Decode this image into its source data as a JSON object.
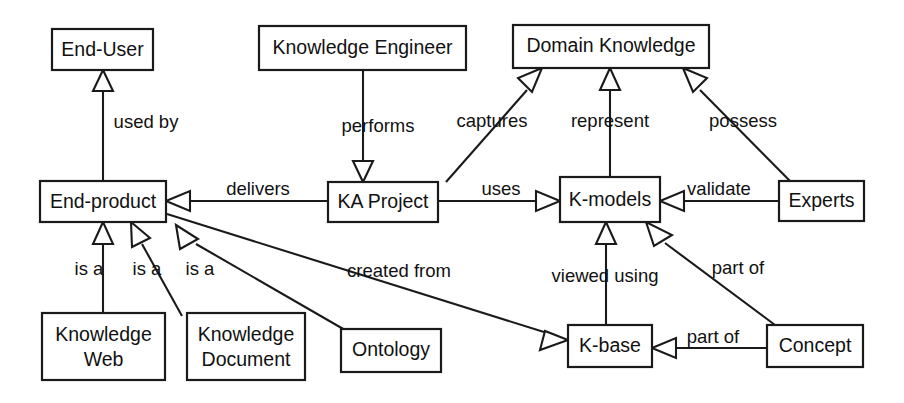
{
  "diagram": {
    "style": {
      "background": "#ffffff",
      "line_color": "#1a1a1a",
      "text_color": "#111111",
      "node_fill": "#ffffff"
    },
    "nodes": [
      {
        "id": "end_user",
        "label": "End-User",
        "x": 52,
        "y": 29,
        "w": 101,
        "h": 41,
        "lines": [
          "End-User"
        ]
      },
      {
        "id": "knowledge_engineer",
        "label": "Knowledge Engineer",
        "x": 259,
        "y": 26,
        "w": 207,
        "h": 44,
        "lines": [
          "Knowledge Engineer"
        ]
      },
      {
        "id": "domain_knowledge",
        "label": "Domain Knowledge",
        "x": 513,
        "y": 25,
        "w": 196,
        "h": 43,
        "lines": [
          "Domain Knowledge"
        ]
      },
      {
        "id": "end_product",
        "label": "End-product",
        "x": 40,
        "y": 181,
        "w": 126,
        "h": 41,
        "lines": [
          "End-product"
        ]
      },
      {
        "id": "ka_project",
        "label": "KA Project",
        "x": 328,
        "y": 182,
        "w": 110,
        "h": 40,
        "lines": [
          "KA Project"
        ]
      },
      {
        "id": "k_models",
        "label": "K-models",
        "x": 560,
        "y": 177,
        "w": 100,
        "h": 45,
        "lines": [
          "K-models"
        ]
      },
      {
        "id": "experts",
        "label": "Experts",
        "x": 779,
        "y": 181,
        "w": 85,
        "h": 40,
        "lines": [
          "Experts"
        ]
      },
      {
        "id": "knowledge_web",
        "label": "Knowledge Web",
        "x": 42,
        "y": 313,
        "w": 123,
        "h": 67,
        "lines": [
          "Knowledge",
          "Web"
        ]
      },
      {
        "id": "knowledge_document",
        "label": "Knowledge Document",
        "x": 187,
        "y": 313,
        "w": 118,
        "h": 67,
        "lines": [
          "Knowledge",
          "Document"
        ]
      },
      {
        "id": "ontology",
        "label": "Ontology",
        "x": 341,
        "y": 329,
        "w": 100,
        "h": 43,
        "lines": [
          "Ontology"
        ]
      },
      {
        "id": "k_base",
        "label": "K-base",
        "x": 568,
        "y": 325,
        "w": 84,
        "h": 42,
        "lines": [
          "K-base"
        ]
      },
      {
        "id": "concept",
        "label": "Concept",
        "x": 767,
        "y": 325,
        "w": 96,
        "h": 42,
        "lines": [
          "Concept"
        ]
      }
    ],
    "edges": [
      {
        "id": "used_by",
        "label": "used by",
        "from": "end_product",
        "to": "end_user",
        "label_x": 146,
        "label_y": 123
      },
      {
        "id": "performs",
        "label": "performs",
        "from": "knowledge_engineer",
        "to": "ka_project",
        "label_x": 378,
        "label_y": 127
      },
      {
        "id": "captures",
        "label": "captures",
        "from": "ka_project",
        "to": "domain_knowledge",
        "label_x": 492,
        "label_y": 122
      },
      {
        "id": "represent",
        "label": "represent",
        "from": "k_models",
        "to": "domain_knowledge",
        "label_x": 610,
        "label_y": 122
      },
      {
        "id": "possess",
        "label": "possess",
        "from": "experts",
        "to": "domain_knowledge",
        "label_x": 743,
        "label_y": 122
      },
      {
        "id": "delivers",
        "label": "delivers",
        "from": "ka_project",
        "to": "end_product",
        "label_x": 258,
        "label_y": 190
      },
      {
        "id": "uses",
        "label": "uses",
        "from": "ka_project",
        "to": "k_models",
        "label_x": 501,
        "label_y": 190
      },
      {
        "id": "validate",
        "label": "validate",
        "from": "experts",
        "to": "k_models",
        "label_x": 719,
        "label_y": 190
      },
      {
        "id": "is_a_web",
        "label": "is a",
        "from": "knowledge_web",
        "to": "end_product",
        "label_x": 89,
        "label_y": 270
      },
      {
        "id": "is_a_document",
        "label": "is a",
        "from": "knowledge_document",
        "to": "end_product",
        "label_x": 147,
        "label_y": 270
      },
      {
        "id": "is_a_ontology",
        "label": "is a",
        "from": "ontology",
        "to": "end_product",
        "label_x": 200,
        "label_y": 270
      },
      {
        "id": "created_from",
        "label": "created from",
        "from": "end_product",
        "to": "k_base",
        "label_x": 399,
        "label_y": 272
      },
      {
        "id": "viewed_using",
        "label": "viewed using",
        "from": "k_base",
        "to": "k_models",
        "label_x": 605,
        "label_y": 277
      },
      {
        "id": "part_of_diag",
        "label": "part of",
        "from": "concept",
        "to": "k_models",
        "label_x": 738,
        "label_y": 269
      },
      {
        "id": "part_of_base",
        "label": "part of",
        "from": "concept",
        "to": "k_base",
        "label_x": 713,
        "label_y": 338
      }
    ]
  }
}
